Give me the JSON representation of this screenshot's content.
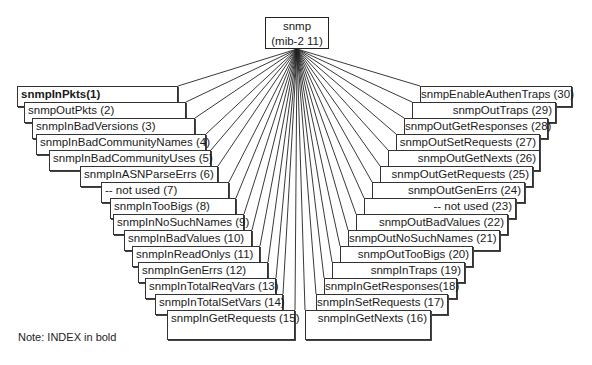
{
  "root": {
    "line1": "snmp",
    "line2": "(mib-2 11)"
  },
  "note": "Note: INDEX in bold",
  "left_nodes": [
    {
      "id": 1,
      "label": "snmpInPkts(1)",
      "bold": true,
      "x": 17,
      "y": 86,
      "r": 178
    },
    {
      "id": 2,
      "label": "snmpOutPkts  (2)",
      "bold": false,
      "x": 24,
      "y": 102,
      "r": 186
    },
    {
      "id": 3,
      "label": "snmpInBadVersions (3)",
      "bold": false,
      "x": 32,
      "y": 118,
      "r": 195
    },
    {
      "id": 4,
      "label": "snmpInBadCommunityNames (4)",
      "bold": false,
      "x": 36,
      "y": 134,
      "r": 206
    },
    {
      "id": 5,
      "label": "snmpInBadCommunityUses (5)",
      "bold": false,
      "x": 49,
      "y": 150,
      "r": 211
    },
    {
      "id": 6,
      "label": "snmpInASNParseErrs (6)",
      "bold": false,
      "x": 80,
      "y": 166,
      "r": 218
    },
    {
      "id": 7,
      "label": "-- not used (7)",
      "bold": false,
      "x": 101,
      "y": 182,
      "r": 229
    },
    {
      "id": 8,
      "label": "snmpInTooBigs (8)",
      "bold": false,
      "x": 110,
      "y": 198,
      "r": 236
    },
    {
      "id": 9,
      "label": "snmpInNoSuchNames (9)",
      "bold": false,
      "x": 113,
      "y": 214,
      "r": 244
    },
    {
      "id": 10,
      "label": "snmpInBadValues (10)",
      "bold": false,
      "x": 124,
      "y": 230,
      "r": 252
    },
    {
      "id": 11,
      "label": "snmpInReadOnlys (11)",
      "bold": false,
      "x": 132,
      "y": 246,
      "r": 260
    },
    {
      "id": 12,
      "label": "snmpInGenErrs (12)",
      "bold": false,
      "x": 138,
      "y": 262,
      "r": 268
    },
    {
      "id": 13,
      "label": "snmpInTotalReqVars (13)",
      "bold": false,
      "x": 145,
      "y": 278,
      "r": 276
    },
    {
      "id": 14,
      "label": "snmpInTotalSetVars (14)",
      "bold": false,
      "x": 155,
      "y": 294,
      "r": 283
    },
    {
      "id": 15,
      "label": "snmpInGetRequests (15)",
      "bold": false,
      "x": 167,
      "y": 310,
      "r": 295,
      "h": 30
    }
  ],
  "right_nodes": [
    {
      "id": 16,
      "label": "snmpInGetNexts (16)",
      "x": 305,
      "y": 310,
      "r": 431,
      "h": 30
    },
    {
      "id": 17,
      "label": "snmpInSetRequests (17)",
      "x": 316,
      "y": 294,
      "r": 448
    },
    {
      "id": 18,
      "label": "snmpInGetResponses(18)",
      "x": 324,
      "y": 278,
      "r": 457
    },
    {
      "id": 19,
      "label": "snmpInTraps (19)",
      "x": 332,
      "y": 262,
      "r": 465
    },
    {
      "id": 20,
      "label": "snmpOutTooBigs (20)",
      "x": 340,
      "y": 246,
      "r": 473
    },
    {
      "id": 21,
      "label": "snmpOutNoSuchNames (21)",
      "x": 348,
      "y": 230,
      "r": 500
    },
    {
      "id": 22,
      "label": "snmpOutBadValues (22)",
      "x": 356,
      "y": 214,
      "r": 508
    },
    {
      "id": 23,
      "label": "-- not used (23)",
      "x": 364,
      "y": 198,
      "r": 516
    },
    {
      "id": 24,
      "label": "snmpOutGenErrs (24)",
      "x": 372,
      "y": 182,
      "r": 525
    },
    {
      "id": 25,
      "label": "snmpOutGetRequests (25)",
      "x": 380,
      "y": 166,
      "r": 533
    },
    {
      "id": 26,
      "label": "snmpOutGetNexts (26)",
      "x": 388,
      "y": 150,
      "r": 540
    },
    {
      "id": 27,
      "label": "snmpOutSetRequests (27)",
      "x": 396,
      "y": 134,
      "r": 540
    },
    {
      "id": 28,
      "label": "snmpOutGetResponses (28)",
      "x": 404,
      "y": 118,
      "r": 548
    },
    {
      "id": 29,
      "label": "snmpOutTraps  (29)",
      "x": 412,
      "y": 102,
      "r": 556
    },
    {
      "id": 30,
      "label": "snmpEnableAuthenTraps (30)",
      "x": 420,
      "y": 86,
      "r": 572
    }
  ],
  "colors": {
    "line": "#222222",
    "box_border": "#333333",
    "background": "#ffffff"
  }
}
